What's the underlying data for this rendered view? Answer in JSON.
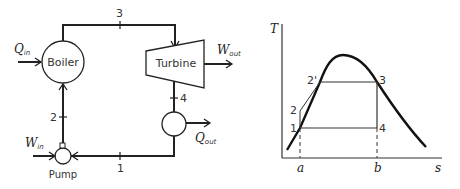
{
  "rankine_cycle_schematic": {
    "components": {
      "boiler": "Boiler",
      "turbine": "Turbine",
      "pump": "Pump",
      "condenser": ""
    },
    "energy_flows": {
      "q_in": {
        "symbol": "Q",
        "subscript": "in"
      },
      "w_out": {
        "symbol": "W",
        "subscript": "out"
      },
      "q_out": {
        "symbol": "Q",
        "subscript": "out"
      },
      "w_in": {
        "symbol": "W",
        "subscript": "in"
      }
    },
    "state_points": [
      "1",
      "2",
      "3",
      "4"
    ]
  },
  "ts_diagram": {
    "y_axis_label": "T",
    "x_axis_label": "s",
    "x_markers": [
      "a",
      "b"
    ],
    "state_points": [
      "1",
      "2",
      "2'",
      "3",
      "4"
    ]
  },
  "colors": {
    "line": "#222222",
    "text": "#333333",
    "background": "#ffffff"
  }
}
